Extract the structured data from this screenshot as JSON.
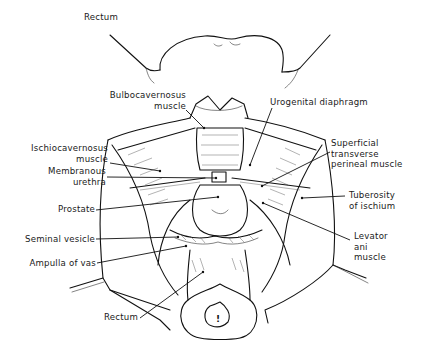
{
  "figure": {
    "type": "anatomical line drawing",
    "colors": {
      "ink": "#111111",
      "background": "#ffffff"
    }
  },
  "labels": {
    "rectum_top": {
      "text": "Rectum"
    },
    "bulbocavernosus": {
      "line1": "Bulbocavernosus",
      "line2": "muscle"
    },
    "urogenital_diaphragm": {
      "text": "Urogenital diaphragm"
    },
    "ischiocavernosus": {
      "line1": "Ischiocavernosus",
      "line2": "muscle"
    },
    "superficial_transverse": {
      "line1": "Superficial",
      "line2": "transverse",
      "line3": "perineal muscle"
    },
    "membranous_urethra": {
      "line1": "Membranous",
      "line2": "urethra"
    },
    "tuberosity": {
      "line1": "Tuberosity",
      "line2": "of ischium"
    },
    "prostate": {
      "text": "Prostate"
    },
    "levator_ani": {
      "line1": "Levator",
      "line2": "ani",
      "line3": "muscle"
    },
    "seminal_vesicle": {
      "text": "Seminal vesicle"
    },
    "ampulla_of_vas": {
      "text": "Ampulla of vas"
    },
    "rectum_bottom": {
      "text": "Rectum"
    }
  },
  "anus_marker": {
    "symbol": "!"
  }
}
